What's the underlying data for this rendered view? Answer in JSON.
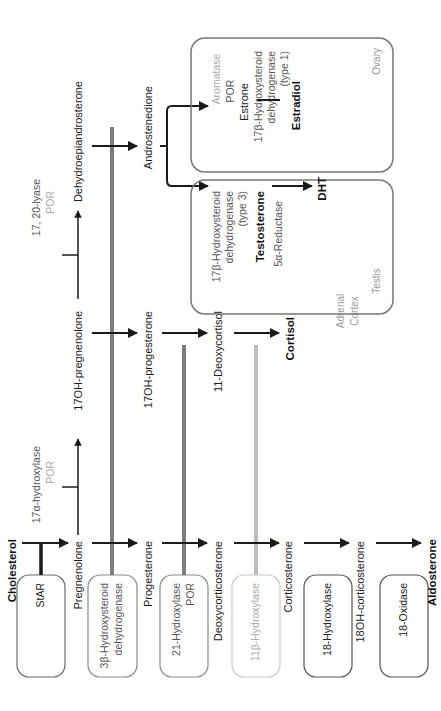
{
  "diagram": {
    "type": "steroidogenesis-pathway",
    "orientation": "rotated-90-ccw",
    "colors": {
      "arrow": "#1a1a1a",
      "bar_dark": "#7d7d7d",
      "bar_light": "#bdbdbd",
      "box_border": "#6a6a6a",
      "box_border_light": "#c8c8c8"
    },
    "precursor": {
      "label": "Cholesterol"
    },
    "enzyme_boxes": [
      {
        "id": "star",
        "lines": [
          "StAR"
        ],
        "style": "dark"
      },
      {
        "id": "hsd3b",
        "lines": [
          "3β-Hydroxysteroid",
          "dehydrogenase"
        ],
        "style": "medium"
      },
      {
        "id": "cyp21",
        "lines": [
          "21-Hydroxylase",
          "POR"
        ],
        "style": "medium"
      },
      {
        "id": "cyp11b1",
        "lines": [
          "11β-Hydroxylase"
        ],
        "style": "light"
      },
      {
        "id": "hydroxylase18",
        "lines": [
          "18-Hydroxylase"
        ],
        "style": "dark"
      },
      {
        "id": "oxidase18",
        "lines": [
          "18-Oxidase"
        ],
        "style": "dark"
      }
    ],
    "mineralocorticoid_column": [
      "Pregnenolone",
      "Progesterone",
      "Deoxycorticosterone",
      "Corticosterone",
      "18OH-corticosterone",
      "Aldosterone"
    ],
    "glucocorticoid_column": [
      "17OH-pregnenolone",
      "17OH-progesterone",
      "11-Deoxycortisol",
      "Cortisol"
    ],
    "androgen_column": [
      "Dehydroepiandrosterone",
      "Androstenedione"
    ],
    "horizontal_enzymes": {
      "cyp17_hydroxylase": [
        "17α-hydroxylase",
        "POR"
      ],
      "cyp17_lyase": [
        "17, 20-lyase",
        "POR"
      ]
    },
    "adrenal_label": [
      "Adrenal",
      "Cortex"
    ],
    "ovary": {
      "label": "Ovary",
      "aromatase": [
        "Aromatase",
        "POR"
      ],
      "product1": "Estrone",
      "enzyme": [
        "17β-Hydroxysteroid",
        "dehydrogenase",
        "(type 1)"
      ],
      "product2": "Estradiol"
    },
    "testis": {
      "label": "Testis",
      "enzyme": [
        "17β-Hydroxysteroid",
        "dehydrogenase",
        "(type 3)"
      ],
      "product1": "Testosterone",
      "enzyme2": [
        "5α-Reductase"
      ],
      "product2": "DHT"
    }
  }
}
